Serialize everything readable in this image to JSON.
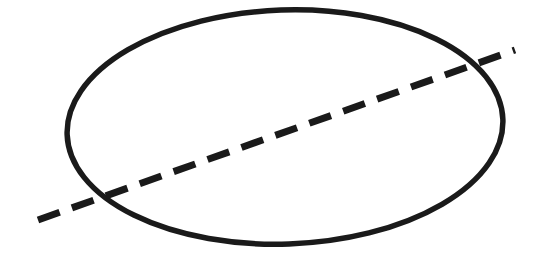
{
  "figure": {
    "title": "Ellipse with dashed line through it",
    "caption": "",
    "width": 534,
    "height": 257,
    "background_color": "#ffffff",
    "ink_color": "#1a1a1a",
    "style": "hand-drawn black ink on white, no text labels"
  },
  "shapes": {
    "ellipse": {
      "name": "ellipse-outline",
      "label": "ellipse",
      "center_x": 285,
      "center_y": 127,
      "radius_x": 218,
      "radius_y": 117,
      "rotation_deg": -2,
      "stroke_color": "#1a1a1a",
      "stroke_width": 5.5,
      "fill": "none",
      "bounds": {
        "left_vertex_x": 67,
        "left_vertex_y": 132,
        "right_vertex_x": 503,
        "right_vertex_y": 122,
        "top_vertex_x": 288,
        "top_vertex_y": 11,
        "bottom_vertex_x": 283,
        "bottom_vertex_y": 243
      }
    },
    "dashed_line": {
      "name": "dashed-chord-line",
      "label": "dashed line",
      "x1": 38,
      "y1": 220,
      "x2": 515,
      "y2": 50,
      "slope": -0.356,
      "angle_deg": -19.6,
      "stroke_color": "#1a1a1a",
      "stroke_width": 7,
      "dash_length": 23,
      "gap_length": 13,
      "extends_beyond_ellipse": true,
      "intersection_lower_left_x": 100,
      "intersection_lower_left_y": 200,
      "intersection_upper_right_x": 462,
      "intersection_upper_right_y": 69
    }
  }
}
